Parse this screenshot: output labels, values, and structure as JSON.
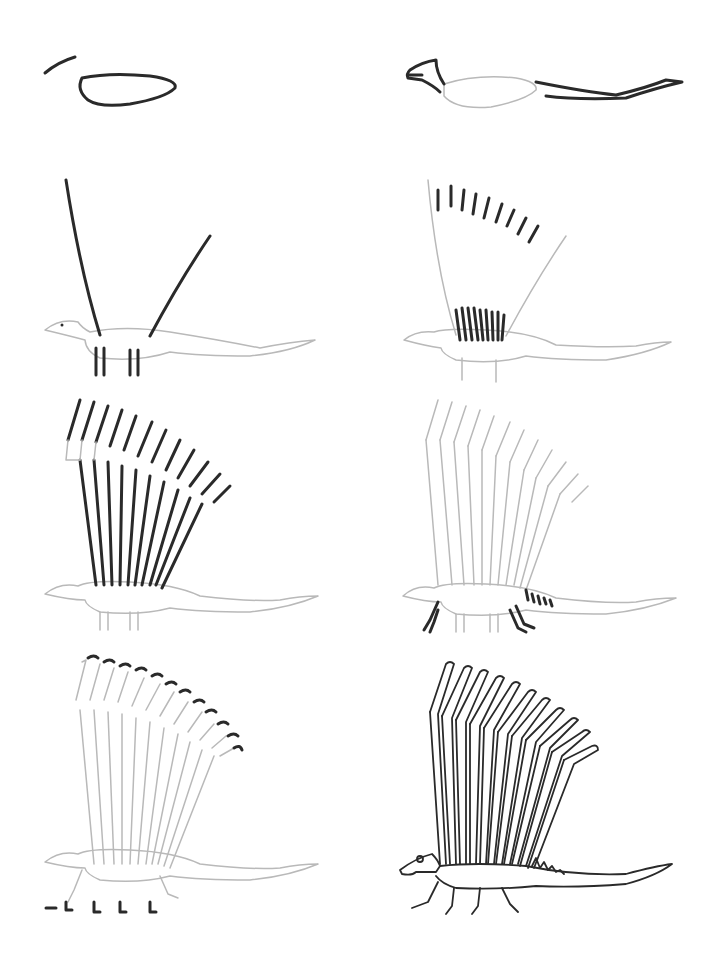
{
  "page": {
    "type": "step-by-step drawing tutorial",
    "background": "#ffffff",
    "stroke_colors": {
      "new_step": "#2a2a2a",
      "previous_steps": "#b9b9b9"
    }
  },
  "panels": [
    {
      "step": 1,
      "description": "Oval body and short curved stroke for head"
    },
    {
      "step": 2,
      "description": "Head wedge and long tapering tail"
    },
    {
      "step": 3,
      "description": "Two long guide lines for the sail and leg stubs"
    },
    {
      "step": 4,
      "description": "Spine base strokes and tip marks"
    },
    {
      "step": 5,
      "description": "Full set of sail spines"
    },
    {
      "step": 6,
      "description": "Legs and small back spikes"
    },
    {
      "step": 7,
      "description": "Hooked tips on the spines and feet"
    },
    {
      "step": 8,
      "description": "Finished inked drawing with doubled spines"
    }
  ]
}
